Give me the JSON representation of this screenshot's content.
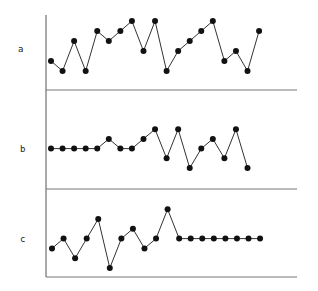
{
  "chart_data": {
    "type": "line",
    "title": "",
    "layout": "three stacked panels sharing one vertical axis, separated by horizontal rules",
    "grid": false,
    "legend": null,
    "marker": "filled-circle",
    "line_color": "#333333",
    "marker_color": "#111111",
    "panels": [
      {
        "label": "a",
        "x": [
          1,
          2,
          3,
          4,
          5,
          6,
          7,
          8,
          9,
          10,
          11,
          12,
          13,
          14,
          15,
          16,
          17,
          18,
          19
        ],
        "values": [
          2,
          1,
          4,
          1,
          5,
          4,
          5,
          6,
          3,
          6,
          1,
          3,
          4,
          5,
          6,
          2,
          3,
          1,
          5
        ]
      },
      {
        "label": "b",
        "x": [
          1,
          2,
          3,
          4,
          5,
          6,
          7,
          8,
          9,
          10,
          11,
          12,
          13,
          14,
          15,
          16,
          17,
          18
        ],
        "values": [
          3,
          3,
          3,
          3,
          3,
          4,
          3,
          3,
          4,
          5,
          2,
          5,
          1,
          3,
          4,
          2,
          5,
          1
        ]
      },
      {
        "label": "c",
        "x": [
          1,
          2,
          3,
          4,
          5,
          6,
          7,
          8,
          9,
          10,
          11,
          12,
          13,
          14,
          15,
          16,
          17,
          18,
          19
        ],
        "values": [
          3,
          4,
          2,
          4,
          6,
          1,
          4,
          5,
          3,
          4,
          7,
          4,
          4,
          4,
          4,
          4,
          4,
          4,
          4
        ]
      }
    ]
  },
  "labels": {
    "a": "a",
    "b": "b",
    "c": "c"
  }
}
